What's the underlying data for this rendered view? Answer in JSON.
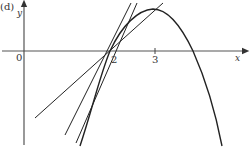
{
  "figure": {
    "panel_label": "(d)",
    "axes": {
      "x_label": "x",
      "y_label": "y",
      "origin_label": "0",
      "ticks": [
        {
          "label": "2",
          "value": 2
        },
        {
          "label": "3",
          "value": 3
        }
      ]
    },
    "curve": {
      "description": "Downward-opening curve passing through (2,0), peak near x=3, crossing x-axis again beyond 3"
    },
    "lines": {
      "description": "Secant/tangent lines through point (2,0), approaching the tangent line",
      "count": 3
    }
  }
}
